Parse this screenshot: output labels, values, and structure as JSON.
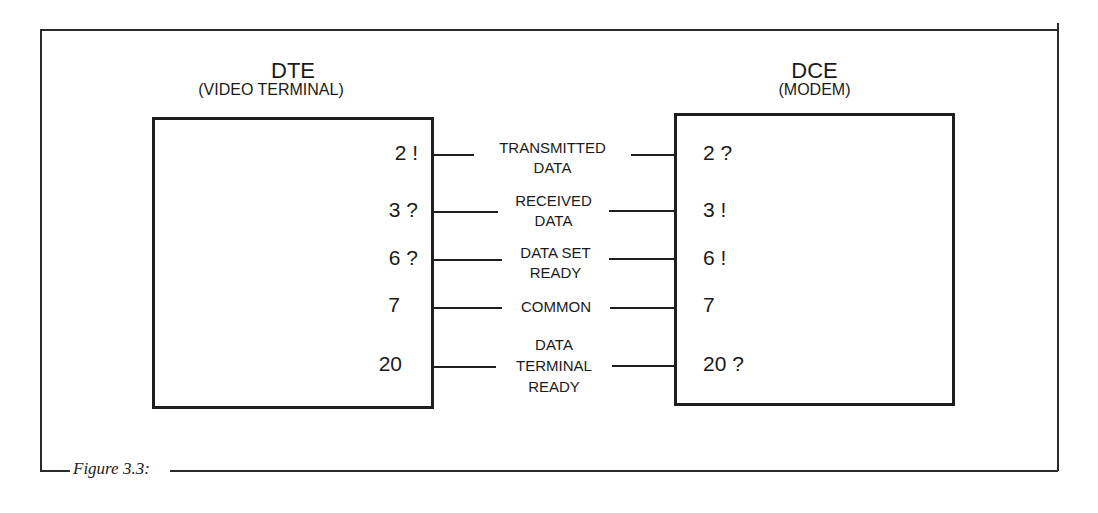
{
  "figure": {
    "caption": "Figure 3.3:"
  },
  "dte": {
    "title": "DTE",
    "subtitle": "(VIDEO TERMINAL)",
    "pins": [
      "2 !",
      "3 ?",
      "6 ?",
      "7",
      "20"
    ]
  },
  "dce": {
    "title": "DCE",
    "subtitle": "(MODEM)",
    "pins": [
      "2 ?",
      "3 !",
      "6 !",
      "7",
      "20 ?"
    ]
  },
  "signals": [
    {
      "line1": "TRANSMITTED",
      "line2": "DATA",
      "line3": ""
    },
    {
      "line1": "RECEIVED",
      "line2": "DATA",
      "line3": ""
    },
    {
      "line1": "DATA SET",
      "line2": "READY",
      "line3": ""
    },
    {
      "line1": "COMMON",
      "line2": "",
      "line3": ""
    },
    {
      "line1": "DATA",
      "line2": "TERMINAL",
      "line3": "READY"
    }
  ]
}
